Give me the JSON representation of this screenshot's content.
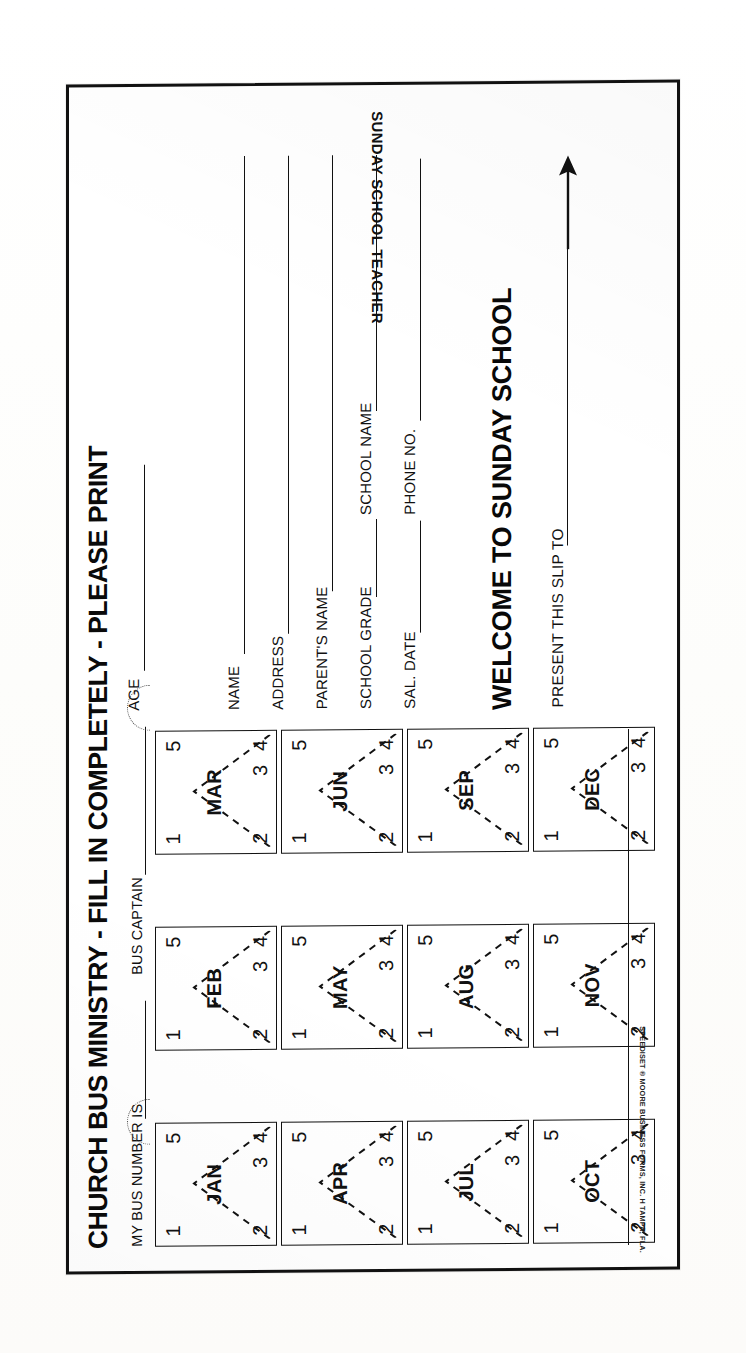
{
  "document": {
    "title": "CHURCH BUS MINISTRY - FILL IN COMPLETELY - PLEASE PRINT",
    "teacher_label": "SUNDAY SCHOOL TEACHER",
    "fine_print": "SPEEDISET ® MOORE BUSINESS FORMS, INC.  H  TAMPA, FLA."
  },
  "bus_info": {
    "bus_number_label": "MY BUS NUMBER IS",
    "bus_captain_label": "BUS CAPTAIN",
    "bus_number_value": "",
    "bus_captain_value": ""
  },
  "attendance_grid": {
    "week_numbers": [
      "1",
      "2",
      "3",
      "4",
      "5"
    ],
    "rows": [
      {
        "months": [
          "JAN",
          "FEB",
          "MAR"
        ]
      },
      {
        "months": [
          "APR",
          "MAY",
          "JUN"
        ]
      },
      {
        "months": [
          "JUL",
          "AUG",
          "SEP"
        ]
      },
      {
        "months": [
          "OCT",
          "NOV",
          "DEC"
        ]
      }
    ]
  },
  "fields": [
    {
      "label": "AGE",
      "value": ""
    },
    {
      "label": "NAME",
      "value": ""
    },
    {
      "label": "ADDRESS",
      "value": ""
    },
    {
      "label": "PARENT'S NAME",
      "value": ""
    },
    {
      "label": "SCHOOL GRADE",
      "value": ""
    },
    {
      "label": "SCHOOL NAME",
      "value": ""
    },
    {
      "label": "SAL. DATE",
      "value": ""
    },
    {
      "label": "PHONE NO.",
      "value": ""
    }
  ],
  "welcome": {
    "heading": "WELCOME TO SUNDAY SCHOOL",
    "present_label": "PRESENT THIS SLIP TO",
    "present_value": ""
  },
  "colors": {
    "ink": "#111111",
    "paper": "#ffffff",
    "border": "#111111"
  }
}
